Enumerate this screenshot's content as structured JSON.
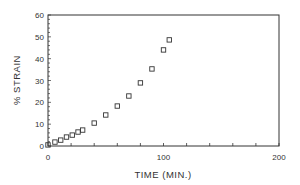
{
  "chart_data": {
    "type": "scatter",
    "title": "",
    "xlabel": "TIME (MIN.)",
    "ylabel": "% STRAIN",
    "xlim": [
      0,
      200
    ],
    "ylim": [
      0,
      60
    ],
    "x_ticks_major": [
      0,
      100,
      200
    ],
    "x_tick_labels": [
      "0",
      "100",
      "200"
    ],
    "x_ticks_minor_step": 20,
    "y_ticks_major": [
      0,
      10,
      20,
      30,
      40,
      50,
      60
    ],
    "y_tick_labels": [
      "0",
      "10",
      "20",
      "30",
      "40",
      "50",
      "60"
    ],
    "y_ticks_minor_step": 2,
    "grid": false,
    "legend": null,
    "marker": "open-square",
    "series": [
      {
        "name": "strain",
        "x": [
          0,
          6,
          11,
          16,
          21,
          26,
          30,
          40,
          50,
          60,
          70,
          80,
          90,
          100,
          105
        ],
        "y": [
          0.5,
          1.8,
          2.7,
          4.1,
          5.0,
          6.4,
          7.3,
          10.5,
          14.2,
          18.3,
          22.9,
          28.9,
          35.3,
          44.0,
          48.6
        ]
      }
    ]
  },
  "colors": {
    "axis": "#333333",
    "marker": "#333333",
    "background": "#ffffff"
  }
}
